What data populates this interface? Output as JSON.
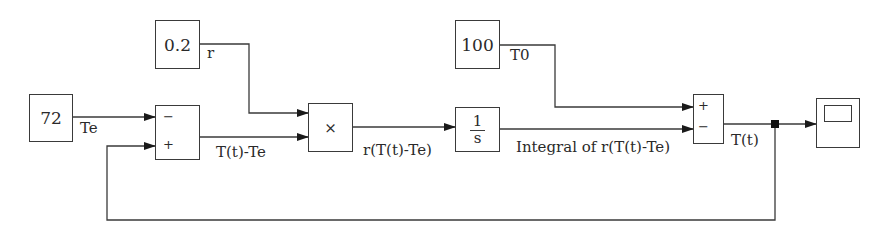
{
  "diagram": {
    "type": "simulink-block-diagram",
    "blocks": {
      "const_te": {
        "value": "72"
      },
      "const_r": {
        "value": "0.2"
      },
      "const_t0": {
        "value": "100"
      },
      "sum1": {
        "signs": [
          "−",
          "+"
        ]
      },
      "product": {
        "symbol": "×"
      },
      "integrator": {
        "numerator": "1",
        "denominator": "s"
      },
      "sum2": {
        "signs": [
          "+",
          "−"
        ]
      },
      "scope": {
        "label": ""
      }
    },
    "signals": {
      "te": "Te",
      "r": "r",
      "t0": "T0",
      "diff": "T(t)-Te",
      "product_out": "r(T(t)-Te)",
      "integral_out": "Integral of r(T(t)-Te)",
      "tt": "T(t)"
    },
    "colors": {
      "line": "#3a3a3a",
      "background": "#ffffff"
    }
  }
}
